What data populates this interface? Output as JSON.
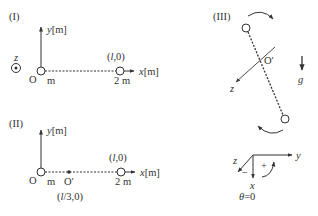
{
  "diagram": {
    "colors": {
      "ink": "#333333",
      "background": "#ffffff"
    },
    "panel_1": {
      "label": "(I)",
      "y_axis_label": "y[m]",
      "x_axis_label": "x[m]",
      "z_out_of_page_label": "z",
      "z_icon": "dot-in-circle-icon",
      "origin_label": "O",
      "mass_left_label": "m",
      "mass_right_label": "2 m",
      "right_point_coords": "(l,0)"
    },
    "panel_2": {
      "label": "(II)",
      "y_axis_label": "y[m]",
      "x_axis_label": "x[m]",
      "origin_label": "O",
      "pivot_label": "O′",
      "pivot_coords": "(l/3,0)",
      "mass_left_label": "m",
      "mass_right_label": "2 m",
      "right_point_coords": "(l,0)"
    },
    "panel_3": {
      "label": "(III)",
      "pivot_label": "O′",
      "z_axis_label": "z",
      "gravity_label": "g"
    },
    "axes_inset": {
      "y_label": "y",
      "z_label": "z",
      "x_label": "x",
      "plus_label": "+",
      "minus_label": "−",
      "theta_label": "θ = 0"
    }
  }
}
